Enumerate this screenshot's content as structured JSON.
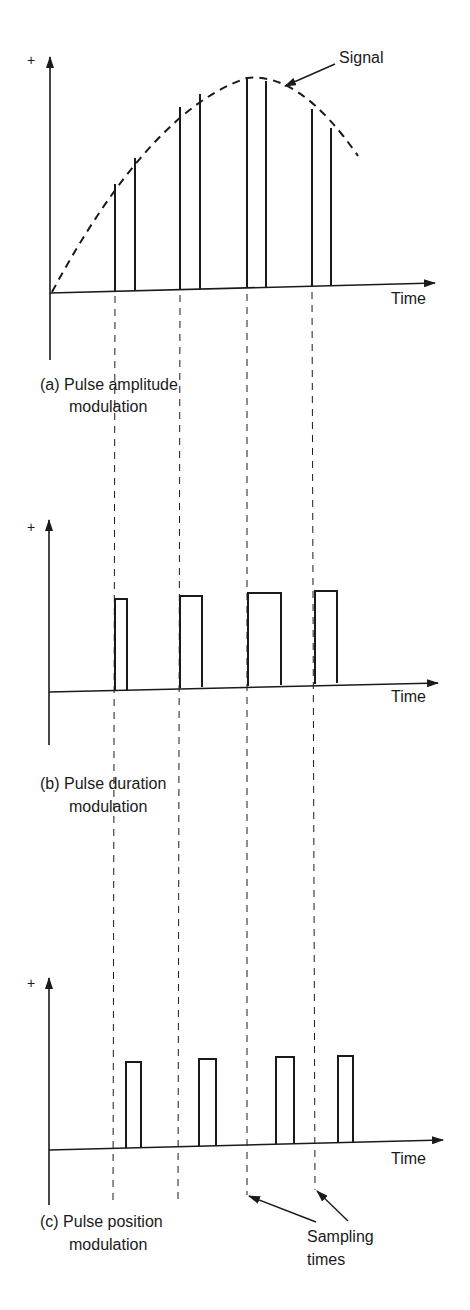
{
  "figure": {
    "signal_label": "Signal",
    "time_label": "Time",
    "plus_label": "+",
    "sampling_label_line1": "Sampling",
    "sampling_label_line2": "times",
    "panels": [
      {
        "id": "a",
        "caption_line1": "(a) Pulse amplitude",
        "caption_line2": "modulation"
      },
      {
        "id": "b",
        "caption_line1": "(b) Pulse duration",
        "caption_line2": "modulation"
      },
      {
        "id": "c",
        "caption_line1": "(c) Pulse position",
        "caption_line2": "modulation"
      }
    ],
    "colors": {
      "ink": "#1a1a1a",
      "background": "#ffffff"
    }
  }
}
